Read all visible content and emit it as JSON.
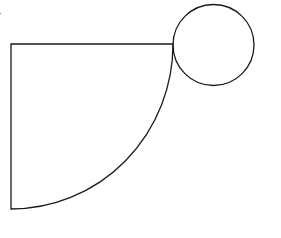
{
  "diagram": {
    "stroke_color": "#1a1a1a",
    "background": "#ffffff",
    "sector": {
      "corner": [
        11,
        44
      ],
      "top_end": [
        173,
        44
      ],
      "bottom_end": [
        11,
        209
      ],
      "radius_x": 162,
      "radius_y": 165
    },
    "circle": {
      "center": [
        213.5,
        45
      ],
      "radius": 40.5
    }
  }
}
